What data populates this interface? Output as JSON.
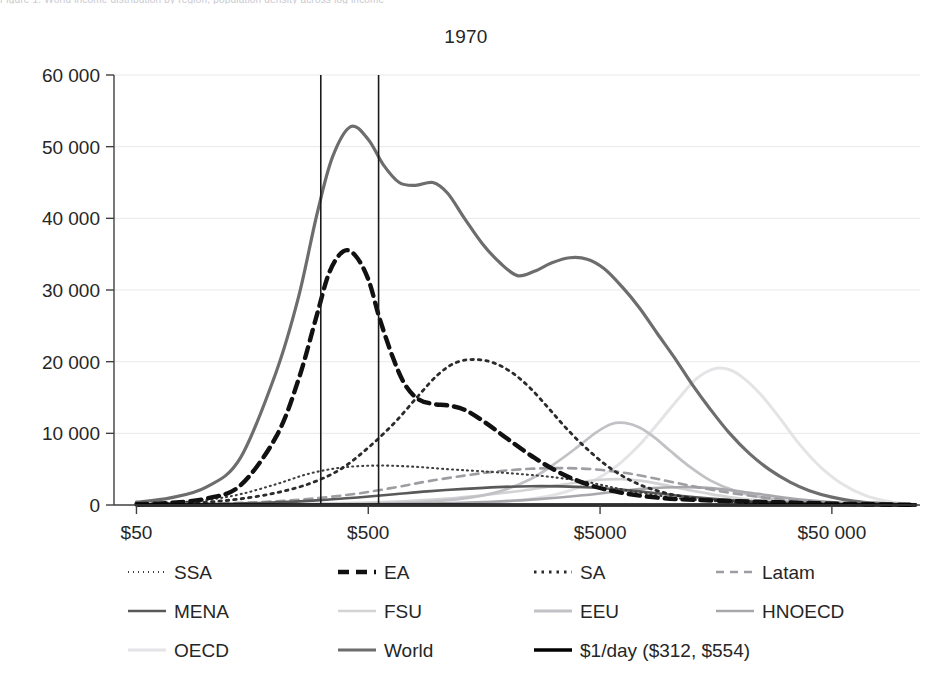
{
  "page": {
    "clipped_header_text": "Figure 1.  World income distribution by region, population density across log income",
    "title": "1970"
  },
  "chart_data": {
    "type": "line",
    "title": "1970",
    "xlabel": "",
    "ylabel": "",
    "xscale": "log",
    "xlim": [
      40,
      120000
    ],
    "ylim": [
      0,
      60000
    ],
    "grid": true,
    "legend_position": "bottom",
    "xticks": [
      {
        "value": 50,
        "label": "$50"
      },
      {
        "value": 500,
        "label": "$500"
      },
      {
        "value": 5000,
        "label": "$5000"
      },
      {
        "value": 50000,
        "label": "$50 000"
      }
    ],
    "yticks": [
      {
        "value": 0,
        "label": "0"
      },
      {
        "value": 10000,
        "label": "10 000"
      },
      {
        "value": 20000,
        "label": "20 000"
      },
      {
        "value": 30000,
        "label": "30 000"
      },
      {
        "value": 40000,
        "label": "40 000"
      },
      {
        "value": 50000,
        "label": "50 000"
      },
      {
        "value": 60000,
        "label": "60 000"
      }
    ],
    "vertical_reference_lines": [
      {
        "value": 312,
        "label": "$312"
      },
      {
        "value": 554,
        "label": "$554"
      }
    ],
    "series": [
      {
        "name": "SSA",
        "label": "SSA",
        "color": "#3f3f3f",
        "width": 2.1,
        "dash": "1,4",
        "x": [
          50,
          70,
          100,
          140,
          200,
          280,
          390,
          550,
          780,
          1100,
          1550,
          2200,
          3100,
          4400,
          6200,
          8800,
          12000,
          18000,
          26000,
          38000,
          55000,
          80000,
          110000
        ],
        "y": [
          150,
          320,
          700,
          1500,
          2900,
          4400,
          5250,
          5500,
          5350,
          5000,
          4700,
          4350,
          3900,
          3200,
          2200,
          1350,
          800,
          430,
          230,
          120,
          60,
          30,
          15
        ]
      },
      {
        "name": "EA",
        "label": "EA",
        "color": "#111111",
        "width": 4.4,
        "dash": "11,7",
        "x": [
          50,
          70,
          100,
          140,
          200,
          250,
          300,
          340,
          390,
          440,
          500,
          560,
          640,
          720,
          820,
          950,
          1100,
          1300,
          1600,
          2000,
          2600,
          3400,
          4500,
          6200,
          9000,
          13000,
          20000,
          30000,
          45000,
          70000,
          110000
        ],
        "y": [
          120,
          300,
          900,
          2700,
          9500,
          17500,
          26500,
          32500,
          35400,
          34800,
          31500,
          26000,
          20500,
          16800,
          14800,
          14100,
          13900,
          13300,
          11500,
          9200,
          6600,
          4400,
          2800,
          1700,
          1000,
          700,
          520,
          380,
          230,
          110,
          40
        ]
      },
      {
        "name": "SA",
        "label": "SA",
        "color": "#2b2b2b",
        "width": 2.8,
        "dash": "2.5,5",
        "x": [
          50,
          70,
          100,
          140,
          200,
          280,
          380,
          500,
          650,
          820,
          1000,
          1200,
          1450,
          1750,
          2100,
          2500,
          3000,
          3600,
          4400,
          5500,
          7000,
          9000,
          12000,
          17000,
          24000,
          35000,
          55000,
          85000,
          115000
        ],
        "y": [
          80,
          180,
          400,
          850,
          1700,
          3000,
          5000,
          8000,
          11500,
          15200,
          18200,
          19900,
          20300,
          19800,
          18400,
          16300,
          13500,
          10600,
          7800,
          5200,
          3200,
          1900,
          1050,
          580,
          300,
          160,
          80,
          35,
          15
        ]
      },
      {
        "name": "Latam",
        "label": "Latam",
        "color": "#9d9da2",
        "width": 2.6,
        "dash": "8,6",
        "x": [
          50,
          80,
          130,
          200,
          300,
          450,
          650,
          900,
          1300,
          1800,
          2500,
          3400,
          4600,
          6200,
          8200,
          11000,
          15000,
          21000,
          30000,
          45000,
          65000,
          95000,
          115000
        ],
        "y": [
          60,
          130,
          260,
          520,
          950,
          1600,
          2450,
          3300,
          4100,
          4700,
          5050,
          5150,
          5000,
          4550,
          3850,
          3000,
          2150,
          1400,
          800,
          400,
          180,
          70,
          30
        ]
      },
      {
        "name": "MENA",
        "label": "MENA",
        "color": "#595959",
        "width": 2.6,
        "dash": "none",
        "x": [
          50,
          80,
          130,
          200,
          300,
          450,
          650,
          900,
          1300,
          1800,
          2500,
          3400,
          4600,
          6200,
          8200,
          11000,
          15000,
          21000,
          30000,
          45000,
          65000,
          95000,
          115000
        ],
        "y": [
          40,
          90,
          180,
          360,
          650,
          1050,
          1500,
          1900,
          2250,
          2500,
          2620,
          2600,
          2450,
          2150,
          1750,
          1300,
          900,
          560,
          320,
          160,
          70,
          25,
          10
        ]
      },
      {
        "name": "FSU",
        "label": "FSU",
        "color": "#d3d3d6",
        "width": 2.6,
        "dash": "none",
        "x": [
          50,
          100,
          200,
          400,
          700,
          1100,
          1600,
          2300,
          3200,
          4200,
          5200,
          6200,
          7400,
          9000,
          11000,
          14000,
          18000,
          24000,
          33000,
          48000,
          70000,
          100000,
          115000
        ],
        "y": [
          20,
          50,
          110,
          260,
          520,
          900,
          1400,
          2000,
          2700,
          3250,
          3550,
          3600,
          3400,
          2950,
          2350,
          1700,
          1100,
          650,
          340,
          150,
          60,
          20,
          10
        ]
      },
      {
        "name": "EEU",
        "label": "EEU",
        "color": "#c2c2c6",
        "width": 2.8,
        "dash": "none",
        "x": [
          50,
          150,
          350,
          700,
          1200,
          1800,
          2500,
          3200,
          4000,
          4800,
          5600,
          6400,
          7400,
          8600,
          10000,
          12000,
          15000,
          19000,
          25000,
          34000,
          48000,
          70000,
          100000,
          115000
        ],
        "y": [
          10,
          30,
          90,
          280,
          800,
          1800,
          3600,
          5800,
          8100,
          10100,
          11300,
          11450,
          10800,
          9400,
          7600,
          5500,
          3400,
          2000,
          1050,
          480,
          180,
          60,
          20,
          8
        ]
      },
      {
        "name": "HNOECD",
        "label": "HNOECD",
        "color": "#a8a8ac",
        "width": 2.6,
        "dash": "none",
        "x": [
          50,
          150,
          400,
          900,
          1700,
          2800,
          4200,
          5800,
          7600,
          9600,
          12000,
          15000,
          19000,
          24000,
          31000,
          41000,
          55000,
          75000,
          100000,
          115000
        ],
        "y": [
          8,
          25,
          70,
          190,
          450,
          850,
          1350,
          1850,
          2250,
          2450,
          2500,
          2350,
          2000,
          1550,
          1050,
          620,
          300,
          120,
          40,
          18
        ]
      },
      {
        "name": "OECD",
        "label": "OECD",
        "color": "#e4e4e7",
        "width": 3.0,
        "dash": "none",
        "x": [
          50,
          200,
          600,
          1400,
          2600,
          4000,
          5600,
          7200,
          9000,
          11000,
          13000,
          15500,
          18000,
          21000,
          25000,
          30000,
          36000,
          44000,
          55000,
          70000,
          90000,
          115000
        ],
        "y": [
          5,
          15,
          60,
          260,
          900,
          2400,
          4900,
          8000,
          11600,
          15000,
          17600,
          19000,
          18900,
          17600,
          15200,
          12000,
          8600,
          5500,
          3000,
          1300,
          420,
          100
        ]
      },
      {
        "name": "World",
        "label": "World",
        "color": "#6d6d6d",
        "width": 3.2,
        "dash": "none",
        "x": [
          50,
          70,
          100,
          140,
          200,
          250,
          300,
          350,
          420,
          500,
          580,
          680,
          800,
          950,
          1100,
          1300,
          1550,
          1850,
          2200,
          2600,
          3100,
          3700,
          4400,
          5200,
          6200,
          7400,
          8800,
          10500,
          12500,
          15000,
          18000,
          22000,
          27000,
          33000,
          40000,
          50000,
          62000,
          78000,
          100000,
          115000
        ],
        "y": [
          400,
          1000,
          2500,
          6500,
          18500,
          29000,
          40500,
          48500,
          52800,
          51000,
          47500,
          45000,
          44600,
          45000,
          43500,
          40000,
          36500,
          33800,
          32000,
          32600,
          33800,
          34500,
          34300,
          33000,
          30500,
          27500,
          24000,
          20500,
          16800,
          13300,
          10100,
          7200,
          4900,
          3200,
          2000,
          1100,
          560,
          250,
          80,
          35
        ]
      },
      {
        "name": "$1/day",
        "label": "$1/day ($312, $554)",
        "color": "#000000",
        "width": 3.4,
        "dash": "none",
        "is_reference": true,
        "x": [
          50,
          115000
        ],
        "y": [
          0,
          0
        ]
      }
    ]
  },
  "legend": {
    "rows": [
      [
        "SSA",
        "EA",
        "SA",
        "Latam"
      ],
      [
        "MENA",
        "FSU",
        "EEU",
        "HNOECD"
      ],
      [
        "OECD",
        "World",
        "$1/day ($312, $554)"
      ]
    ]
  }
}
